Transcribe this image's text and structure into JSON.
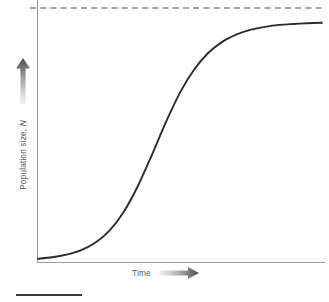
{
  "figure": {
    "background_color": "#ffffff",
    "width": 329,
    "height": 302
  },
  "axes": {
    "y_axis": {
      "label_text": "Population size,",
      "label_symbol": "N",
      "label_full": "Population size, N",
      "arrow_icon": "up-arrow-gradient-icon",
      "arrow_direction": "up",
      "color": "#9a9a9a",
      "label_color": "#5a5a5a"
    },
    "x_axis": {
      "label_text": "Time",
      "arrow_icon": "right-arrow-gradient-icon",
      "arrow_direction": "right",
      "color": "#9a9a9a",
      "label_color": "#5a5a5a"
    }
  },
  "annotations": {
    "asymptote": {
      "name": "carrying-capacity-dashed-line",
      "style": "dashed",
      "color": "#4a4a4a",
      "label": ""
    },
    "bottom_rule": {
      "name": "bottom-rule",
      "color": "#3a3a3a"
    }
  },
  "chart_data": {
    "type": "line",
    "title": "",
    "xlabel": "Time",
    "ylabel": "Population size, N",
    "grid": false,
    "legend": null,
    "xlim": [
      0,
      10
    ],
    "ylim": [
      0,
      1.08
    ],
    "curve_color": "#2b2b2b",
    "series": [
      {
        "name": "Logistic growth",
        "model": "logistic",
        "carrying_capacity": 1.0,
        "inflection_x": 4.2,
        "inflection_y": 0.5,
        "growth_rate": 1.15,
        "x": [
          0.0,
          0.5,
          1.0,
          1.5,
          2.0,
          2.5,
          3.0,
          3.5,
          4.0,
          4.5,
          5.0,
          5.5,
          6.0,
          6.5,
          7.0,
          7.5,
          8.0,
          8.5,
          9.0,
          9.5,
          10.0
        ],
        "values": [
          0.008,
          0.014,
          0.025,
          0.043,
          0.074,
          0.124,
          0.201,
          0.309,
          0.441,
          0.58,
          0.705,
          0.802,
          0.872,
          0.919,
          0.949,
          0.969,
          0.981,
          0.989,
          0.993,
          0.996,
          0.998
        ]
      }
    ],
    "reference_lines": [
      {
        "name": "carrying-capacity",
        "orientation": "horizontal",
        "y": 1.06,
        "style": "dashed",
        "color": "#4a4a4a"
      }
    ]
  }
}
